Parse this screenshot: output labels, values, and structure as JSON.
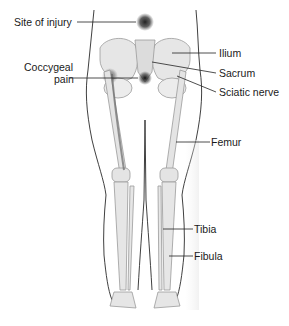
{
  "diagram": {
    "labels": {
      "site_of_injury": "Site of injury",
      "coccygeal_line1": "Coccygeal",
      "coccygeal_line2": "pain",
      "ilium": "Ilium",
      "sacrum": "Sacrum",
      "sciatic_nerve": "Sciatic nerve",
      "femur": "Femur",
      "tibia": "Tibia",
      "fibula": "Fibula"
    },
    "colors": {
      "bone": "#e6e6e6",
      "bone_outline": "#9a9a9a",
      "skin_outline": "#2a2a2a",
      "injury_spot": "#333333",
      "nerve": "#7a7a7a",
      "leader_line": "#222222"
    }
  }
}
